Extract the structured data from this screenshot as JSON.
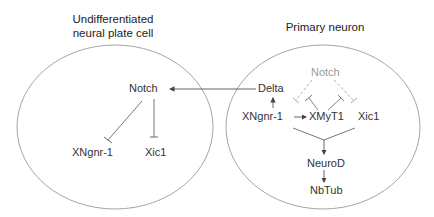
{
  "cells": {
    "left": {
      "title_line1": "Undifferentiated",
      "title_line2": "neural plate cell",
      "nodes": {
        "notch": "Notch",
        "xngnr1": "XNgnr-1",
        "xic1": "Xic1"
      }
    },
    "right": {
      "title": "Primary neuron",
      "nodes": {
        "delta": "Delta",
        "notch": "Notch",
        "xngnr1": "XNgnr-1",
        "xmyt1": "XMyT1",
        "xic1": "Xic1",
        "neurod": "NeuroD",
        "nbtub": "NbTub"
      }
    }
  },
  "edges": [
    {
      "from": "right.delta",
      "to": "left.notch",
      "type": "activation"
    },
    {
      "from": "left.notch",
      "to": "left.xngnr1",
      "type": "inhibition"
    },
    {
      "from": "left.notch",
      "to": "left.xic1",
      "type": "inhibition"
    },
    {
      "from": "right.xngnr1",
      "to": "right.delta",
      "type": "activation"
    },
    {
      "from": "right.xngnr1",
      "to": "right.xmyt1",
      "type": "activation"
    },
    {
      "from": "right.notch",
      "to": "right.xngnr1",
      "type": "inhibition",
      "style": "dashed"
    },
    {
      "from": "right.notch",
      "to": "right.xic1",
      "type": "inhibition",
      "style": "dashed"
    },
    {
      "from": "right.xmyt1",
      "to": "right.notch-xngnr1-edge",
      "type": "inhibition"
    },
    {
      "from": "right.xmyt1",
      "to": "right.notch-xic1-edge",
      "type": "inhibition"
    },
    {
      "from": "right.xngnr1+xic1",
      "to": "right.neurod",
      "type": "activation"
    },
    {
      "from": "right.neurod",
      "to": "right.nbtub",
      "type": "activation"
    }
  ],
  "colors": {
    "line": "#555555",
    "ellipse": "#9a9a9a",
    "dashed": "#a8a8a8",
    "text": "#333333",
    "muted_text": "#9a9a9a"
  }
}
